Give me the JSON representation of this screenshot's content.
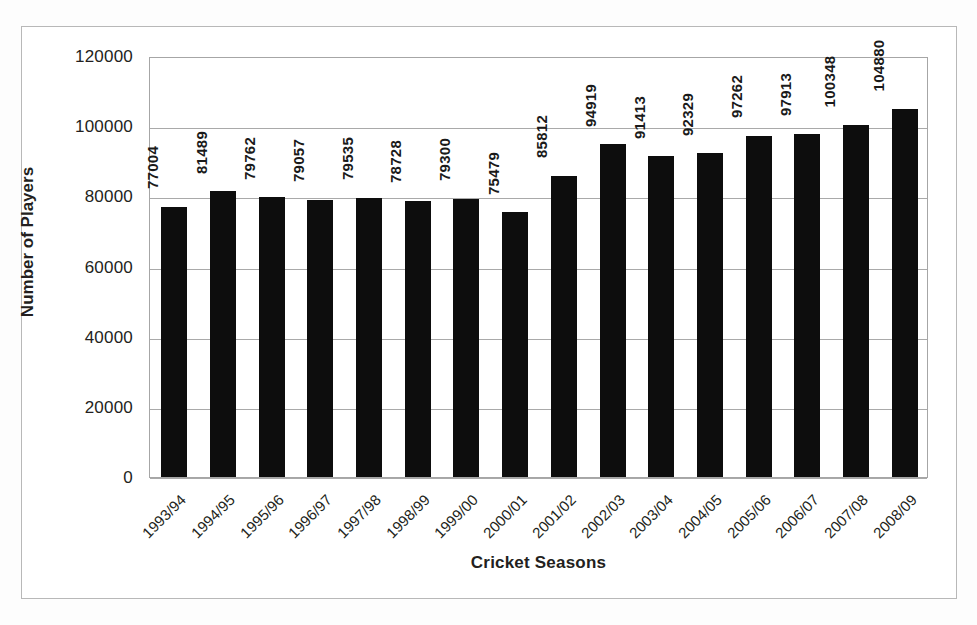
{
  "chart_data": {
    "type": "bar",
    "title": "",
    "xlabel": "Cricket Seasons",
    "ylabel": "Number of Players",
    "categories": [
      "1993/94",
      "1994/95",
      "1995/96",
      "1996/97",
      "1997/98",
      "1998/99",
      "1999/00",
      "2000/01",
      "2001/02",
      "2002/03",
      "2003/04",
      "2004/05",
      "2005/06",
      "2006/07",
      "2007/08",
      "2008/09"
    ],
    "values": [
      77004,
      81489,
      79762,
      79057,
      79535,
      78728,
      79300,
      75479,
      85812,
      94919,
      91413,
      92329,
      97262,
      97913,
      100348,
      104880
    ],
    "value_labels": [
      "77004",
      "81489",
      "79762",
      "79057",
      "79535",
      "78728",
      "79300",
      "75479",
      "85812",
      "94919",
      "91413",
      "92329",
      "97262",
      "97913",
      "100348",
      "104880"
    ],
    "ylim": [
      0,
      120000
    ],
    "y_ticks": [
      0,
      20000,
      40000,
      60000,
      80000,
      100000,
      120000
    ],
    "y_tick_labels": [
      "0",
      "20000",
      "40000",
      "60000",
      "80000",
      "100000",
      "120000"
    ],
    "grid": true,
    "legend": "none",
    "bar_color": "#0d0d0d",
    "plot_background": "#ffffff",
    "gridline_color": "#a9a9a9",
    "axis_color": "#a6a6a6"
  }
}
